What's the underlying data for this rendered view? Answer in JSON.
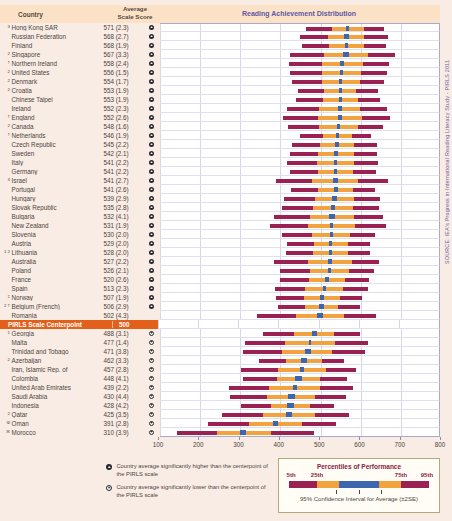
{
  "meta": {
    "source": "SOURCE: IEA's Progress in International Reading Literacy Study - PIRLS 2011"
  },
  "header": {
    "country_col": "Country",
    "score_col": "Average Scale Score",
    "chart_title": "Reading Achievement Distribution"
  },
  "centerpoint": {
    "label": "PIRLS Scale Centerpoint",
    "score": "500",
    "insert_after": "Romania"
  },
  "footer": {
    "higher": "Country average significantly higher than the centerpoint of the PIRLS scale",
    "lower": "Country average significantly lower than the centerpoint of the PIRLS scale",
    "legend_title": "Percentiles of Performance",
    "pct_labels": [
      "5th",
      "25th",
      "75th",
      "95th"
    ],
    "ci_label": "95% Confidence Interval for Average (±2SE)"
  },
  "colors": {
    "bar_maroon": "#9c2153",
    "bar_orange": "#f2a340",
    "bar_blue": "#3c67b0",
    "centerpoint_orange": "#e2601a",
    "accent_purple": "#5f57a6",
    "band_peach": "#fbe2c6",
    "page_pink": "#f8ece4"
  },
  "chart_data": {
    "type": "bar",
    "title": "Reading Achievement Distribution",
    "xlim": [
      100,
      800
    ],
    "xticks": [
      100,
      200,
      300,
      400,
      500,
      600,
      700,
      800
    ],
    "legend_position": "bottom-right",
    "grid": true,
    "note": "Horizontal distribution bars per country: [5th, 25th, 75th, 95th] percentiles; blue segment is 95% confidence interval for average (avg ± 2SE). Percentile values estimated from gridlines.",
    "countries": [
      {
        "prefix": "3",
        "name": "Hong Kong SAR",
        "avg": 571,
        "se": 2.3,
        "display": "571 (2.3)",
        "sig": "higher",
        "pct": [
          468,
          531,
          611,
          662
        ]
      },
      {
        "prefix": "",
        "name": "Russian Federation",
        "avg": 568,
        "se": 2.7,
        "display": "568 (2.7)",
        "sig": "higher",
        "pct": [
          451,
          522,
          613,
          672
        ]
      },
      {
        "prefix": "",
        "name": "Finland",
        "avg": 568,
        "se": 1.9,
        "display": "568 (1.9)",
        "sig": "higher",
        "pct": [
          456,
          524,
          611,
          667
        ]
      },
      {
        "prefix": "2",
        "name": "Singapore",
        "avg": 567,
        "se": 3.3,
        "display": "567 (3.3)",
        "sig": "higher",
        "pct": [
          427,
          513,
          621,
          691
        ]
      },
      {
        "prefix": "†",
        "name": "Northern Ireland",
        "avg": 558,
        "se": 2.4,
        "display": "558 (2.4)",
        "sig": "higher",
        "pct": [
          425,
          506,
          609,
          676
        ]
      },
      {
        "prefix": "2",
        "name": "United States",
        "avg": 556,
        "se": 1.5,
        "display": "556 (1.5)",
        "sig": "higher",
        "pct": [
          428,
          506,
          605,
          669
        ]
      },
      {
        "prefix": "2",
        "name": "Denmark",
        "avg": 554,
        "se": 1.7,
        "display": "554 (1.7)",
        "sig": "higher",
        "pct": [
          431,
          506,
          601,
          663
        ]
      },
      {
        "prefix": "2",
        "name": "Croatia",
        "avg": 553,
        "se": 1.9,
        "display": "553 (1.9)",
        "sig": "higher",
        "pct": [
          448,
          512,
          593,
          646
        ]
      },
      {
        "prefix": "",
        "name": "Chinese Taipei",
        "avg": 553,
        "se": 1.9,
        "display": "553 (1.9)",
        "sig": "higher",
        "pct": [
          441,
          509,
          596,
          652
        ]
      },
      {
        "prefix": "",
        "name": "Ireland",
        "avg": 552,
        "se": 2.3,
        "display": "552 (2.3)",
        "sig": "higher",
        "pct": [
          419,
          500,
          603,
          670
        ]
      },
      {
        "prefix": "†",
        "name": "England",
        "avg": 552,
        "se": 2.6,
        "display": "552 (2.6)",
        "sig": "higher",
        "pct": [
          410,
          497,
          606,
          678
        ]
      },
      {
        "prefix": "2",
        "name": "Canada",
        "avg": 548,
        "se": 1.6,
        "display": "548 (1.6)",
        "sig": "higher",
        "pct": [
          422,
          499,
          596,
          660
        ]
      },
      {
        "prefix": "†",
        "name": "Netherlands",
        "avg": 546,
        "se": 1.9,
        "display": "546 (1.9)",
        "sig": "higher",
        "pct": [
          451,
          509,
          582,
          630
        ]
      },
      {
        "prefix": "",
        "name": "Czech Republic",
        "avg": 545,
        "se": 2.2,
        "display": "545 (2.2)",
        "sig": "higher",
        "pct": [
          433,
          501,
          588,
          644
        ]
      },
      {
        "prefix": "",
        "name": "Sweden",
        "avg": 542,
        "se": 2.1,
        "display": "542 (2.1)",
        "sig": "higher",
        "pct": [
          427,
          497,
          586,
          644
        ]
      },
      {
        "prefix": "",
        "name": "Italy",
        "avg": 541,
        "se": 2.2,
        "display": "541 (2.2)",
        "sig": "higher",
        "pct": [
          420,
          494,
          587,
          648
        ]
      },
      {
        "prefix": "",
        "name": "Germany",
        "avg": 541,
        "se": 2.2,
        "display": "541 (2.2)",
        "sig": "higher",
        "pct": [
          426,
          496,
          585,
          643
        ]
      },
      {
        "prefix": "3",
        "name": "Israel",
        "avg": 541,
        "se": 2.7,
        "display": "541 (2.7)",
        "sig": "higher",
        "pct": [
          392,
          483,
          598,
          673
        ]
      },
      {
        "prefix": "",
        "name": "Portugal",
        "avg": 541,
        "se": 2.6,
        "display": "541 (2.6)",
        "sig": "higher",
        "pct": [
          429,
          497,
          584,
          640
        ]
      },
      {
        "prefix": "",
        "name": "Hungary",
        "avg": 539,
        "se": 2.9,
        "display": "539 (2.9)",
        "sig": "higher",
        "pct": [
          411,
          489,
          588,
          652
        ]
      },
      {
        "prefix": "",
        "name": "Slovak Republic",
        "avg": 535,
        "se": 2.8,
        "display": "535 (2.8)",
        "sig": "higher",
        "pct": [
          406,
          485,
          585,
          650
        ]
      },
      {
        "prefix": "",
        "name": "Bulgaria",
        "avg": 532,
        "se": 4.1,
        "display": "532 (4.1)",
        "sig": "higher",
        "pct": [
          387,
          476,
          588,
          661
        ]
      },
      {
        "prefix": "",
        "name": "New Zealand",
        "avg": 531,
        "se": 1.9,
        "display": "531 (1.9)",
        "sig": "higher",
        "pct": [
          377,
          471,
          590,
          667
        ]
      },
      {
        "prefix": "",
        "name": "Slovenia",
        "avg": 530,
        "se": 2.0,
        "display": "530 (2.0)",
        "sig": "higher",
        "pct": [
          406,
          482,
          578,
          640
        ]
      },
      {
        "prefix": "",
        "name": "Austria",
        "avg": 529,
        "se": 2.0,
        "display": "529 (2.0)",
        "sig": "higher",
        "pct": [
          419,
          486,
          571,
          627
        ]
      },
      {
        "prefix": "1 2",
        "name": "Lithuania",
        "avg": 528,
        "se": 2.0,
        "display": "528 (2.0)",
        "sig": "higher",
        "pct": [
          416,
          484,
          571,
          627
        ]
      },
      {
        "prefix": "",
        "name": "Australia",
        "avg": 527,
        "se": 2.2,
        "display": "527 (2.2)",
        "sig": "higher",
        "pct": [
          387,
          473,
          581,
          651
        ]
      },
      {
        "prefix": "",
        "name": "Poland",
        "avg": 526,
        "se": 2.1,
        "display": "526 (2.1)",
        "sig": "higher",
        "pct": [
          402,
          478,
          574,
          636
        ]
      },
      {
        "prefix": "",
        "name": "France",
        "avg": 520,
        "se": 2.6,
        "display": "520 (2.6)",
        "sig": "higher",
        "pct": [
          403,
          474,
          565,
          624
        ]
      },
      {
        "prefix": "",
        "name": "Spain",
        "avg": 513,
        "se": 2.3,
        "display": "513 (2.3)",
        "sig": "higher",
        "pct": [
          390,
          465,
          560,
          622
        ]
      },
      {
        "prefix": "‡",
        "name": "Norway",
        "avg": 507,
        "se": 1.9,
        "display": "507 (1.9)",
        "sig": "higher",
        "pct": [
          393,
          463,
          551,
          608
        ]
      },
      {
        "prefix": "2 †",
        "name": "Belgium (French)",
        "avg": 506,
        "se": 2.9,
        "display": "506 (2.9)",
        "sig": "higher",
        "pct": [
          398,
          464,
          548,
          602
        ]
      },
      {
        "prefix": "",
        "name": "Romania",
        "avg": 502,
        "se": 4.3,
        "display": "502 (4.3)",
        "sig": null,
        "pct": [
          345,
          441,
          562,
          642
        ]
      },
      {
        "prefix": "1",
        "name": "Georgia",
        "avg": 488,
        "se": 3.1,
        "display": "488 (3.1)",
        "sig": "lower",
        "pct": [
          360,
          438,
          537,
          601
        ]
      },
      {
        "prefix": "",
        "name": "Malta",
        "avg": 477,
        "se": 1.4,
        "display": "477 (1.4)",
        "sig": "lower",
        "pct": [
          314,
          414,
          539,
          621
        ]
      },
      {
        "prefix": "",
        "name": "Trinidad and Tobago",
        "avg": 471,
        "se": 3.8,
        "display": "471 (3.8)",
        "sig": "lower",
        "pct": [
          308,
          408,
          533,
          615
        ]
      },
      {
        "prefix": "2",
        "name": "Azerbaijan",
        "avg": 462,
        "se": 3.3,
        "display": "462 (3.3)",
        "sig": "lower",
        "pct": [
          348,
          418,
          506,
          563
        ]
      },
      {
        "prefix": "",
        "name": "Iran, Islamic Rep. of",
        "avg": 457,
        "se": 2.8,
        "display": "457 (2.8)",
        "sig": "lower",
        "pct": [
          303,
          397,
          516,
          593
        ]
      },
      {
        "prefix": "",
        "name": "Colombia",
        "avg": 448,
        "se": 4.1,
        "display": "448 (4.1)",
        "sig": "lower",
        "pct": [
          310,
          394,
          501,
          570
        ]
      },
      {
        "prefix": "",
        "name": "United Arab Emirates",
        "avg": 439,
        "se": 2.2,
        "display": "439 (2.2)",
        "sig": "lower",
        "pct": [
          275,
          375,
          502,
          585
        ]
      },
      {
        "prefix": "",
        "name": "Saudi Arabia",
        "avg": 430,
        "se": 4.4,
        "display": "430 (4.4)",
        "sig": "lower",
        "pct": [
          276,
          370,
          489,
          566
        ]
      },
      {
        "prefix": "",
        "name": "Indonesia",
        "avg": 428,
        "se": 4.2,
        "display": "428 (4.2)",
        "sig": "lower",
        "pct": [
          304,
          380,
          476,
          538
        ]
      },
      {
        "prefix": "2",
        "name": "Qatar",
        "avg": 425,
        "se": 3.5,
        "display": "425 (3.5)",
        "sig": "lower",
        "pct": [
          257,
          360,
          489,
          574
        ]
      },
      {
        "prefix": "Ψ",
        "name": "Oman",
        "avg": 391,
        "se": 2.8,
        "display": "391 (2.8)",
        "sig": "lower",
        "pct": [
          221,
          325,
          456,
          541
        ]
      },
      {
        "prefix": "Ж",
        "name": "Morocco",
        "avg": 310,
        "se": 3.9,
        "display": "310 (3.9)",
        "sig": "lower",
        "pct": [
          145,
          245,
          380,
          487
        ]
      }
    ]
  }
}
